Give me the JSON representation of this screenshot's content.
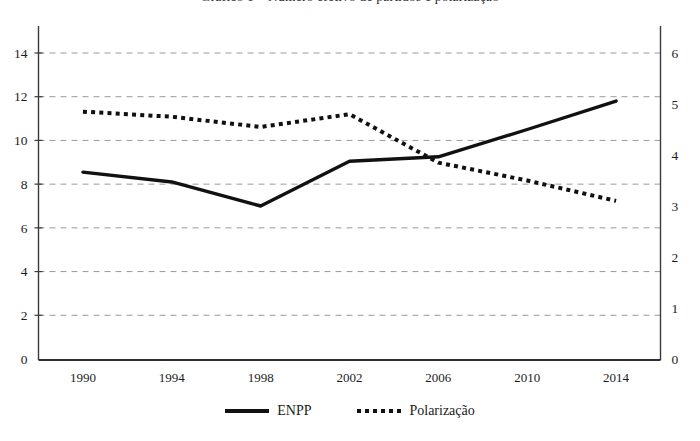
{
  "figure": {
    "title_partial": "Gráfico 1 – Número efetivo de partidos e polarização",
    "background_color": "#ffffff"
  },
  "chart_data": {
    "type": "line",
    "title": "",
    "xlabel": "",
    "ylabel": "",
    "x": [
      1990,
      1994,
      1998,
      2002,
      2006,
      2010,
      2014
    ],
    "categories": [
      "1990",
      "1994",
      "1998",
      "2002",
      "2006",
      "2010",
      "2014"
    ],
    "xticklabels": [
      "1990",
      "1994",
      "1998",
      "2002",
      "2006",
      "2010",
      "2014"
    ],
    "xlim": [
      1988,
      2016
    ],
    "grid": true,
    "grid_axis": "y",
    "legend_position": "bottom-center",
    "series": [
      {
        "name": "ENPP",
        "axis": "left",
        "style": "solid",
        "color": "#111111",
        "values": [
          8.55,
          8.1,
          7.0,
          9.05,
          9.25,
          10.5,
          11.8
        ]
      },
      {
        "name": "Polarização",
        "axis": "right",
        "style": "dotted",
        "color": "#111111",
        "values": [
          4.85,
          4.75,
          4.55,
          4.8,
          3.85,
          3.5,
          3.1
        ]
      }
    ],
    "axis_left": {
      "ylim": [
        0,
        14
      ],
      "ticks": [
        0,
        2,
        4,
        6,
        8,
        10,
        12,
        14
      ],
      "ticklabels": [
        "0",
        "2",
        "4",
        "6",
        "8",
        "10",
        "12",
        "14"
      ]
    },
    "axis_right": {
      "ylim": [
        0,
        6
      ],
      "ticks": [
        0,
        1,
        2,
        3,
        4,
        5,
        6
      ],
      "ticklabels": [
        "0",
        "1",
        "2",
        "3",
        "4",
        "5",
        "6"
      ]
    }
  },
  "legend": {
    "items": [
      {
        "label": "ENPP",
        "style": "solid",
        "swatch": "solid-line-swatch"
      },
      {
        "label": "Polarização",
        "style": "dotted",
        "swatch": "dotted-line-swatch"
      }
    ]
  }
}
